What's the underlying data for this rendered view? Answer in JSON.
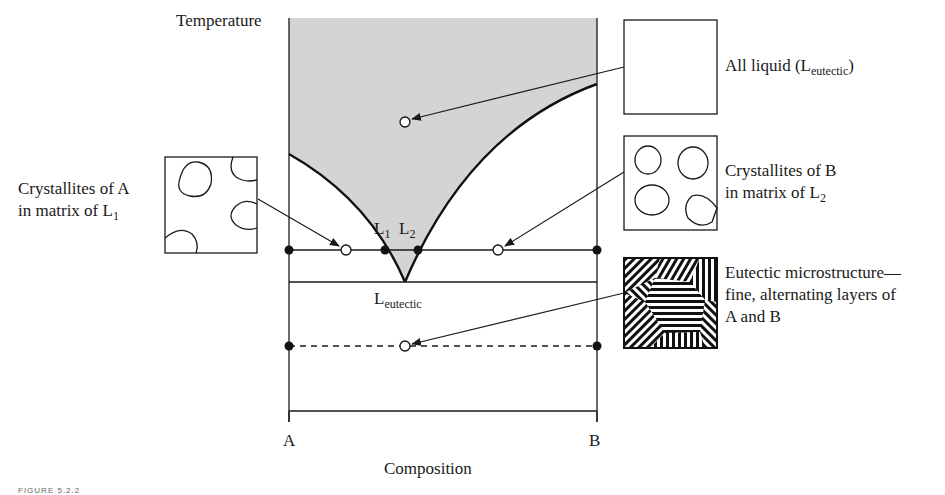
{
  "figure": {
    "caption_fragment": "FIGURE 5.2.2",
    "axes": {
      "y_label": "Temperature",
      "x_label": "Composition",
      "x_left": "A",
      "x_right": "B"
    },
    "points": {
      "L1": {
        "main": "L",
        "sub": "1"
      },
      "L2": {
        "main": "L",
        "sub": "2"
      },
      "eutectic": {
        "main": "L",
        "sub": "eutectic"
      }
    },
    "annotations": [
      {
        "id": "all-liquid",
        "text_main": "All liquid (L",
        "text_sub": "eutectic",
        "text_end": ")",
        "microstructure": "empty"
      },
      {
        "id": "crystallites-b",
        "line1": "Crystallites of B",
        "line2_main": "in matrix of L",
        "line2_sub": "2",
        "microstructure": "four-grains"
      },
      {
        "id": "crystallites-a",
        "line1": "Crystallites of A",
        "line2_main": "in matrix of L",
        "line2_sub": "1",
        "microstructure": "edge-grains"
      },
      {
        "id": "eutectic-microstructure",
        "line1": "Eutectic microstructure—",
        "line2": "fine, alternating layers of",
        "line3": "A and B",
        "microstructure": "lamellar"
      }
    ],
    "colors": {
      "liquid_region": "#d4d4d4",
      "line": "#1a1a1a",
      "background": "#ffffff"
    }
  }
}
